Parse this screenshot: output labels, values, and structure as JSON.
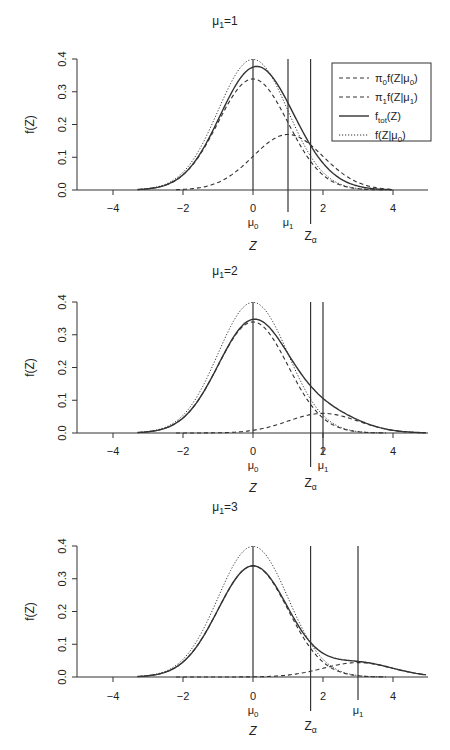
{
  "figure": {
    "xlabel": "Z",
    "ylabel": "f(Z)",
    "xticks": [
      -4,
      -2,
      0,
      2,
      4
    ],
    "yticks": [
      "0.0",
      "0.1",
      "0.2",
      "0.3",
      "0.4"
    ],
    "legend": [
      {
        "label_main": "π",
        "sub1": "0",
        "label_rest": "f(Z|μ",
        "sub2": "0",
        "close": ")",
        "style": "dashed"
      },
      {
        "label_main": "π",
        "sub1": "1",
        "label_rest": "f(Z|μ",
        "sub2": "1",
        "close": ")",
        "style": "dashed"
      },
      {
        "label_main": "f",
        "sub1": "tot",
        "label_rest": "(Z)",
        "sub2": "",
        "close": "",
        "style": "solid"
      },
      {
        "label_main": "f(Z|μ",
        "sub1": "0",
        "label_rest": ")",
        "sub2": "",
        "close": "",
        "style": "dotted"
      }
    ],
    "line_color": "#333333"
  },
  "chart_data": [
    {
      "type": "line",
      "title": "μ1=1",
      "xlabel": "Z",
      "ylabel": "f(Z)",
      "xlim": [
        -5,
        5
      ],
      "ylim": [
        0,
        0.4
      ],
      "mu0": 0,
      "mu1": 1,
      "z_alpha": 1.645,
      "markers": {
        "mu0_label": "μ0",
        "mu1_label": "μ1",
        "zalpha_label": "Zα"
      },
      "series": [
        {
          "name": "π0 f(Z|μ0)",
          "style": "dashed",
          "weight": 0.85,
          "mean": 0,
          "peak": 0.34
        },
        {
          "name": "π1 f(Z|μ1)",
          "style": "dashed",
          "weight": 0.425,
          "mean": 1,
          "peak": 0.17
        },
        {
          "name": "f_tot(Z)",
          "style": "solid",
          "peak": 0.35,
          "peak_at": 0.45
        },
        {
          "name": "f(Z|μ0)",
          "style": "dotted",
          "weight": 1.0,
          "mean": 0,
          "peak": 0.4
        }
      ],
      "legend_visible": true
    },
    {
      "type": "line",
      "title": "μ1=2",
      "xlabel": "Z",
      "ylabel": "f(Z)",
      "xlim": [
        -5,
        5
      ],
      "ylim": [
        0,
        0.4
      ],
      "mu0": 0,
      "mu1": 2,
      "z_alpha": 1.645,
      "markers": {
        "mu0_label": "μ0",
        "mu1_label": "μ1",
        "zalpha_label": "Zα"
      },
      "series": [
        {
          "name": "π0 f(Z|μ0)",
          "style": "dashed",
          "weight": 0.85,
          "mean": 0,
          "peak": 0.34
        },
        {
          "name": "π1 f(Z|μ1)",
          "style": "dashed",
          "weight": 0.15,
          "mean": 2,
          "peak": 0.06
        },
        {
          "name": "f_tot(Z)",
          "style": "solid",
          "peak": 0.35,
          "peak_at": 0.05
        },
        {
          "name": "f(Z|μ0)",
          "style": "dotted",
          "weight": 1.0,
          "mean": 0,
          "peak": 0.4
        }
      ],
      "legend_visible": false
    },
    {
      "type": "line",
      "title": "μ1=3",
      "xlabel": "Z",
      "ylabel": "f(Z)",
      "xlim": [
        -5,
        5
      ],
      "ylim": [
        0,
        0.4
      ],
      "mu0": 0,
      "mu1": 3,
      "z_alpha": 1.645,
      "markers": {
        "mu0_label": "μ0",
        "mu1_label": "μ1",
        "zalpha_label": "Zα"
      },
      "series": [
        {
          "name": "π0 f(Z|μ0)",
          "style": "dashed",
          "weight": 0.85,
          "mean": 0,
          "peak": 0.34
        },
        {
          "name": "π1 f(Z|μ1)",
          "style": "dashed",
          "weight": 0.11,
          "mean": 3,
          "peak": 0.044
        },
        {
          "name": "f_tot(Z)",
          "style": "solid",
          "peak": 0.36,
          "peak_at": 0.0
        },
        {
          "name": "f(Z|μ0)",
          "style": "dotted",
          "weight": 1.0,
          "mean": 0,
          "peak": 0.4
        }
      ],
      "legend_visible": false
    }
  ]
}
